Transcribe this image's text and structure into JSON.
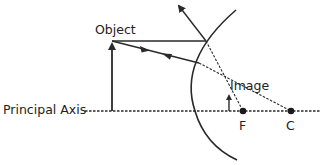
{
  "diagram": {
    "labels": {
      "object": "Object",
      "image": "Image",
      "principal_axis": "Principal Axis",
      "focal_point": "F",
      "center_of_curvature": "C"
    },
    "colors": {
      "line": "#2a2a2a",
      "background": "#ffffff"
    }
  }
}
